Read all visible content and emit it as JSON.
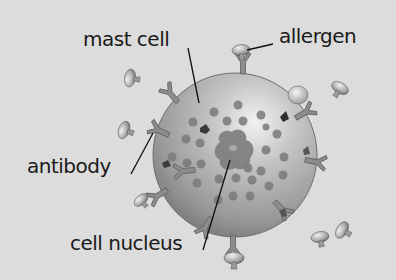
{
  "diagram": {
    "background_color": "#dcdcdc",
    "labels": {
      "mast_cell": "mast cell",
      "allergen": "allergen",
      "antibody": "antibody",
      "cell_nucleus": "cell nucleus"
    },
    "components": [
      {
        "id": "mast-cell",
        "shape": "sphere",
        "color": "#a9a9a9"
      },
      {
        "id": "cell-nucleus",
        "shape": "irregular blob",
        "color": "#7d7d7d"
      },
      {
        "id": "granules",
        "shape": "dots",
        "color": "#7a7a7a"
      },
      {
        "id": "antibodies",
        "shape": "Y-shaped receptors on cell surface",
        "color": "#8a8a8a"
      },
      {
        "id": "allergens",
        "shape": "mushroom/cap-shaped particles",
        "color": "#b0b0b0"
      }
    ]
  }
}
